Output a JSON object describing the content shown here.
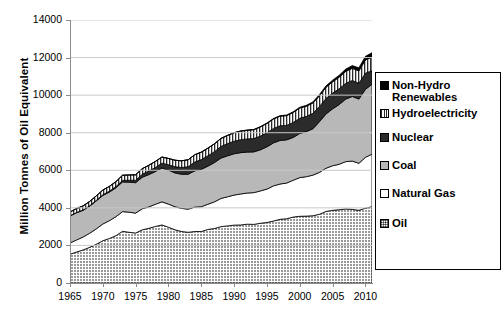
{
  "chart_data": {
    "type": "area",
    "title": "",
    "xlabel": "",
    "ylabel": "Million Tonnes of Oil Equivalent",
    "xlim": [
      1965,
      2011
    ],
    "ylim": [
      0,
      14000
    ],
    "ytick_step": 2000,
    "grid": true,
    "stacked": true,
    "legend_position": "right",
    "ytick_labels": [
      "14000",
      "12000",
      "10000",
      "8000",
      "6000",
      "4000",
      "2000",
      "0"
    ],
    "ytick_values": [
      14000,
      12000,
      10000,
      8000,
      6000,
      4000,
      2000,
      0
    ],
    "xtick_labels": [
      "1965",
      "1970",
      "1975",
      "1980",
      "1985",
      "1990",
      "1995",
      "2000",
      "2005",
      "2010"
    ],
    "xtick_values": [
      1965,
      1970,
      1975,
      1980,
      1985,
      1990,
      1995,
      2000,
      2005,
      2010
    ],
    "x": [
      1965,
      1966,
      1967,
      1968,
      1969,
      1970,
      1971,
      1972,
      1973,
      1974,
      1975,
      1976,
      1977,
      1978,
      1979,
      1980,
      1981,
      1982,
      1983,
      1984,
      1985,
      1986,
      1987,
      1988,
      1989,
      1990,
      1991,
      1992,
      1993,
      1994,
      1995,
      1996,
      1997,
      1998,
      1999,
      2000,
      2001,
      2002,
      2003,
      2004,
      2005,
      2006,
      2007,
      2008,
      2009,
      2010,
      2011
    ],
    "series": [
      {
        "name": "Oil",
        "pattern": "fine-crosshatch-grey",
        "color": "#8f8f8f",
        "values": [
          1530,
          1650,
          1760,
          1900,
          2060,
          2250,
          2370,
          2520,
          2750,
          2700,
          2660,
          2830,
          2910,
          3010,
          3090,
          2970,
          2830,
          2740,
          2700,
          2740,
          2740,
          2850,
          2900,
          3000,
          3040,
          3080,
          3090,
          3130,
          3120,
          3180,
          3220,
          3300,
          3390,
          3420,
          3510,
          3550,
          3560,
          3580,
          3660,
          3810,
          3870,
          3900,
          3940,
          3920,
          3870,
          3980,
          4060
        ]
      },
      {
        "name": "Natural Gas",
        "pattern": "solid-white",
        "color": "#ffffff",
        "values": [
          600,
          640,
          690,
          750,
          820,
          890,
          950,
          1010,
          1050,
          1070,
          1060,
          1120,
          1140,
          1180,
          1230,
          1230,
          1230,
          1230,
          1230,
          1300,
          1320,
          1340,
          1420,
          1500,
          1550,
          1600,
          1650,
          1660,
          1690,
          1720,
          1780,
          1870,
          1880,
          1900,
          1960,
          2060,
          2100,
          2160,
          2230,
          2300,
          2370,
          2420,
          2520,
          2570,
          2500,
          2710,
          2800
        ]
      },
      {
        "name": "Coal",
        "pattern": "solid-lightgrey",
        "color": "#b8b8b8",
        "values": [
          1440,
          1450,
          1420,
          1440,
          1490,
          1520,
          1520,
          1540,
          1580,
          1600,
          1620,
          1680,
          1720,
          1740,
          1800,
          1810,
          1800,
          1820,
          1860,
          1930,
          1990,
          2030,
          2090,
          2150,
          2180,
          2200,
          2200,
          2180,
          2170,
          2190,
          2250,
          2290,
          2320,
          2300,
          2280,
          2350,
          2400,
          2470,
          2700,
          2890,
          3030,
          3180,
          3330,
          3440,
          3420,
          3620,
          3720
        ]
      },
      {
        "name": "Nuclear",
        "pattern": "solid-dark",
        "color": "#2b2b2b",
        "values": [
          10,
          13,
          17,
          22,
          28,
          37,
          48,
          62,
          80,
          100,
          130,
          160,
          190,
          220,
          260,
          290,
          330,
          360,
          400,
          470,
          520,
          550,
          580,
          620,
          650,
          670,
          690,
          700,
          710,
          730,
          750,
          770,
          780,
          770,
          800,
          810,
          810,
          820,
          810,
          830,
          840,
          840,
          840,
          850,
          840,
          860,
          720
        ]
      },
      {
        "name": "Hydroelectricity",
        "pattern": "vertical-stripes",
        "color": "#ffffff",
        "values": [
          200,
          210,
          220,
          230,
          240,
          250,
          255,
          265,
          275,
          280,
          290,
          295,
          305,
          320,
          325,
          330,
          345,
          355,
          370,
          385,
          395,
          405,
          415,
          425,
          435,
          445,
          455,
          460,
          470,
          485,
          495,
          505,
          510,
          520,
          530,
          545,
          540,
          555,
          565,
          590,
          600,
          615,
          635,
          650,
          660,
          700,
          720
        ]
      },
      {
        "name": "Non-Hydro Renewables",
        "pattern": "solid-black",
        "color": "#000000",
        "values": [
          0,
          0,
          0,
          0,
          0,
          0,
          0,
          0,
          0,
          0,
          0,
          0,
          0,
          0,
          0,
          0,
          0,
          0,
          2,
          3,
          4,
          5,
          6,
          7,
          8,
          10,
          12,
          14,
          16,
          18,
          22,
          25,
          28,
          32,
          36,
          42,
          48,
          55,
          64,
          75,
          88,
          102,
          120,
          142,
          162,
          196,
          240
        ]
      }
    ]
  },
  "legend": {
    "items": [
      {
        "label": "Non-Hydro\nRenewables",
        "swatch": "solid-black"
      },
      {
        "label": "Hydroelectricity",
        "swatch": "vertical-stripes"
      },
      {
        "label": "Nuclear",
        "swatch": "solid-dark"
      },
      {
        "label": "Coal",
        "swatch": "solid-lightgrey"
      },
      {
        "label": "Natural Gas",
        "swatch": "solid-white"
      },
      {
        "label": "Oil",
        "swatch": "fine-crosshatch-grey"
      }
    ]
  }
}
